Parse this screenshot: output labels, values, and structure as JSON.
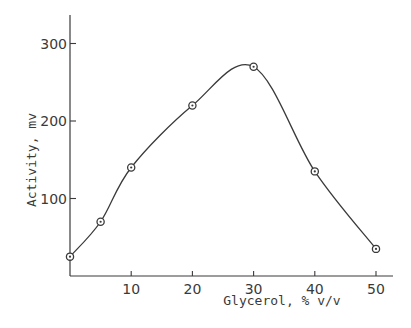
{
  "chart_data": {
    "type": "line",
    "title": "",
    "xlabel": "Glycerol, % v/v",
    "ylabel": "Activity, mv",
    "x": [
      0,
      5,
      10,
      20,
      30,
      40,
      50
    ],
    "series": [
      {
        "name": "Activity",
        "values": [
          25,
          70,
          140,
          220,
          270,
          135,
          35
        ],
        "marker": "circle",
        "smooth": true
      }
    ],
    "xticks": [
      10,
      20,
      30,
      40,
      50
    ],
    "yticks": [
      100,
      200,
      300
    ],
    "xlim": [
      0,
      53
    ],
    "ylim": [
      0,
      335
    ],
    "grid": false,
    "legend": null
  },
  "colors": {
    "ink": "#3a3a3a",
    "background": "#ffffff"
  }
}
